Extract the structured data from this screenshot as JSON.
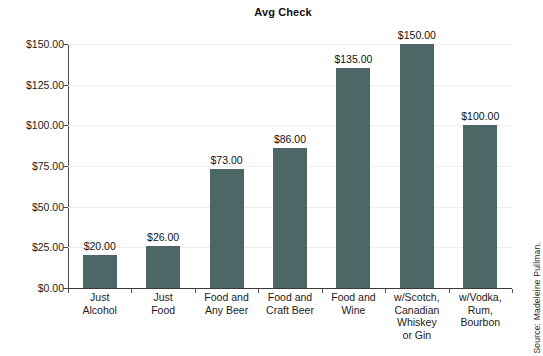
{
  "chart_data": {
    "type": "bar",
    "title": "Avg Check",
    "xlabel": "",
    "ylabel": "",
    "ylim": [
      0,
      150
    ],
    "grid": true,
    "legend": null,
    "categories": [
      "Just Alcohol",
      "Just Food",
      "Food and Any Beer",
      "Food and Craft Beer",
      "Food and Wine",
      "w/Scotch, Canadian Whiskey or Gin",
      "w/Vodka, Rum, Bourbon"
    ],
    "category_lines": [
      [
        "Just",
        "Alcohol"
      ],
      [
        "Just",
        "Food"
      ],
      [
        "Food and",
        "Any Beer"
      ],
      [
        "Food and",
        "Craft Beer"
      ],
      [
        "Food and",
        "Wine"
      ],
      [
        "w/Scotch,",
        "Canadian",
        "Whiskey",
        "or Gin"
      ],
      [
        "w/Vodka,",
        "Rum,",
        "Bourbon"
      ]
    ],
    "values": [
      20,
      26,
      73,
      86,
      135,
      150,
      100
    ],
    "value_labels": [
      "$20.00",
      "$26.00",
      "$73.00",
      "$86.00",
      "$135.00",
      "$150.00",
      "$100.00"
    ],
    "y_ticks": [
      0,
      25,
      50,
      75,
      100,
      125,
      150
    ],
    "y_tick_labels": [
      "$0.00",
      "$25.00",
      "$50.00",
      "$75.00",
      "$100.00",
      "$125.00",
      "$150.00"
    ],
    "bar_color": "#4d6666",
    "gridline_color": "#ededed",
    "axis_color": "#4a4a4a",
    "background_color": "#ffffff"
  },
  "annotations": {
    "source": "Source: Madeleine Pullman."
  }
}
